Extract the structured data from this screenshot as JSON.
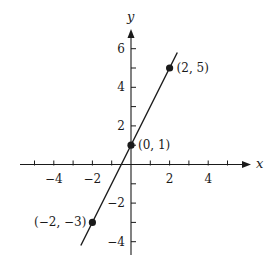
{
  "figure": {
    "x_axis_label": "x",
    "y_axis_label": "y",
    "x_tick_labels": [
      {
        "value": -4,
        "text": "−4"
      },
      {
        "value": -2,
        "text": "−2"
      },
      {
        "value": 2,
        "text": "2"
      },
      {
        "value": 4,
        "text": "4"
      }
    ],
    "y_tick_labels": [
      {
        "value": 6,
        "text": "6"
      },
      {
        "value": 4,
        "text": "4"
      },
      {
        "value": 2,
        "text": "2"
      },
      {
        "value": -2,
        "text": "−2"
      },
      {
        "value": -4,
        "text": "−4"
      }
    ],
    "x_ticks": [
      -5,
      -4,
      -3,
      -2,
      -1,
      1,
      2,
      3,
      4,
      5
    ],
    "y_ticks": [
      -4,
      -3,
      -2,
      -1,
      1,
      2,
      3,
      4,
      5,
      6
    ],
    "line": {
      "equation": "y = 2x + 1",
      "x_start": -2.6,
      "x_end": 2.4
    },
    "points": [
      {
        "x": -2,
        "y": -3,
        "label": "(−2, −3)",
        "label_side": "left"
      },
      {
        "x": 0,
        "y": 1,
        "label": "(0, 1)",
        "label_side": "right"
      },
      {
        "x": 2,
        "y": 5,
        "label": "(2, 5)",
        "label_side": "right"
      }
    ],
    "colors": {
      "ink": "#1a1a1a",
      "background": "#ffffff"
    }
  }
}
